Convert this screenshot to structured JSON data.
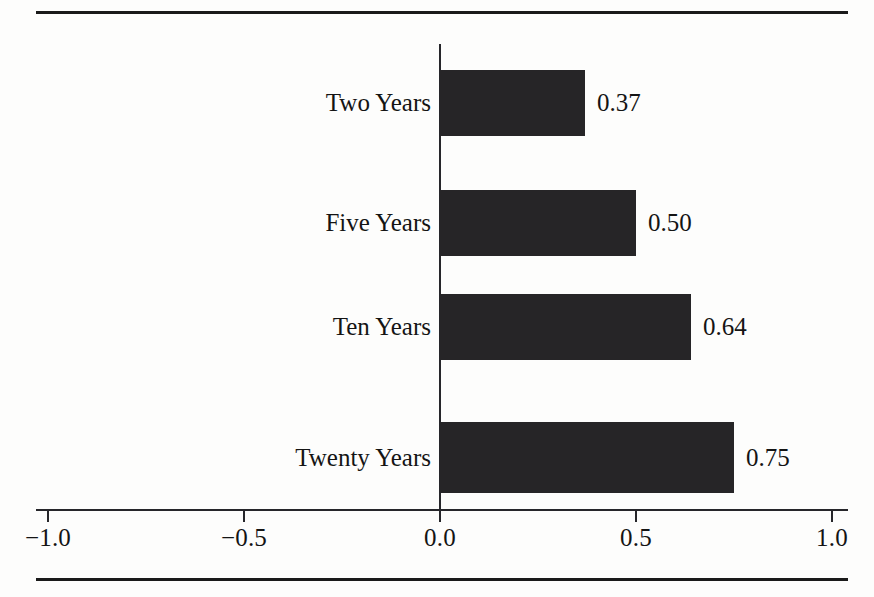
{
  "chart_data": {
    "type": "bar",
    "orientation": "horizontal",
    "title": "",
    "subtitle": "",
    "xlabel": "",
    "ylabel": "",
    "categories": [
      "Two Years",
      "Five Years",
      "Ten Years",
      "Twenty Years"
    ],
    "values": [
      0.37,
      0.5,
      0.64,
      0.75
    ],
    "value_labels": [
      "0.37",
      "0.50",
      "0.64",
      "0.75"
    ],
    "xlim": [
      -1.0,
      1.0
    ],
    "xticks": [
      -1.0,
      -0.5,
      0.0,
      0.5,
      1.0
    ],
    "xtick_labels": [
      "−1.0",
      "−0.5",
      "0.0",
      "0.5",
      "1.0"
    ],
    "grid": false,
    "legend": null,
    "bar_color": "#262527",
    "axis_color": "#26262a",
    "text_color": "#141414",
    "background_color": "#fdfdfc"
  }
}
